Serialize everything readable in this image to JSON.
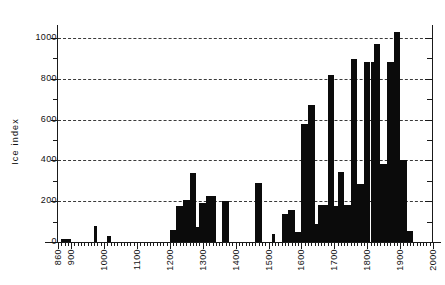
{
  "chart_data": {
    "type": "bar",
    "title": "",
    "subtitle": "",
    "xlabel": "",
    "ylabel": "Ice  index",
    "xlim": [
      860,
      2000
    ],
    "ylim": [
      0,
      1080
    ],
    "grid": true,
    "legend": null,
    "y_ticks_major": [
      0,
      200,
      400,
      600,
      800,
      1000
    ],
    "y_ticks_minor": [
      100,
      300,
      500,
      700,
      900
    ],
    "x_ticks_major": [
      860,
      900,
      1000,
      1100,
      1200,
      1300,
      1400,
      1500,
      1600,
      1700,
      1800,
      1900,
      2000
    ],
    "x_tick_labels": [
      "860",
      "900",
      "1000",
      "1100",
      "1200",
      "1300",
      "1400",
      "1500",
      "1600",
      "1700",
      "1800",
      "1900",
      "2000"
    ],
    "x_tick_interval_minor": 10,
    "bar_width_years": 10,
    "bar_color": "#0b0b0b",
    "grid_color": "#3a3a3a",
    "axis_color": "#1a1a1a",
    "categories": [
      870,
      880,
      890,
      970,
      1010,
      1200,
      1210,
      1220,
      1230,
      1240,
      1250,
      1260,
      1270,
      1280,
      1290,
      1300,
      1310,
      1320,
      1330,
      1360,
      1370,
      1460,
      1470,
      1510,
      1540,
      1550,
      1560,
      1570,
      1580,
      1590,
      1600,
      1610,
      1620,
      1630,
      1640,
      1650,
      1660,
      1670,
      1680,
      1690,
      1700,
      1710,
      1720,
      1730,
      1740,
      1750,
      1760,
      1770,
      1780,
      1790,
      1800,
      1810,
      1820,
      1830,
      1840,
      1850,
      1860,
      1870,
      1880,
      1890,
      1900,
      1910,
      1920,
      1930
    ],
    "values": [
      15,
      15,
      15,
      80,
      30,
      60,
      60,
      175,
      175,
      205,
      205,
      340,
      340,
      75,
      190,
      190,
      225,
      225,
      225,
      200,
      200,
      290,
      290,
      40,
      135,
      135,
      155,
      155,
      50,
      50,
      580,
      580,
      670,
      670,
      90,
      180,
      180,
      180,
      820,
      820,
      175,
      345,
      345,
      180,
      180,
      895,
      895,
      285,
      285,
      880,
      880,
      880,
      970,
      970,
      380,
      380,
      880,
      880,
      1030,
      1030,
      400,
      400,
      55,
      55
    ]
  }
}
